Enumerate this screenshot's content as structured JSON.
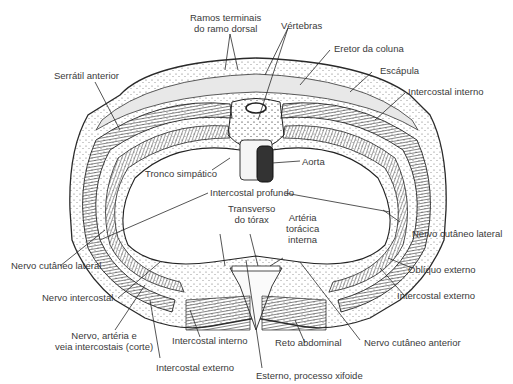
{
  "diagram": {
    "labels": {
      "ramos_terminais_1": "Ramos terminais",
      "ramos_terminais_2": "do ramo dorsal",
      "vertebras": "Vértebras",
      "eretor_da_coluna": "Eretor da coluna",
      "escapula": "Escápula",
      "intercostal_interno_top": "Intercostal interno",
      "serratil_anterior": "Serrátil anterior",
      "tronco_simpatico": "Tronco simpático",
      "aorta": "Aorta",
      "intercostal_profundo": "Intercostal profundo",
      "transverso_1": "Transverso",
      "transverso_2": "do tórax",
      "arteria_1": "Artéria",
      "arteria_2": "torácica",
      "arteria_3": "interna",
      "nervo_cutaneo_lateral_right": "Nervo cutâneo lateral",
      "nervo_cutaneo_lateral_left": "Nervo cutâneo lateral",
      "obliquo_externo": "Oblíquo externo",
      "nervo_intercostal": "Nervo intercostal",
      "intercostal_externo_right": "Intercostal externo",
      "nervo_arteria_1": "Nervo, artéria e",
      "nervo_arteria_2": "veia intercostais (corte)",
      "intercostal_interno_bottom": "Intercostal interno",
      "reto_abdominal": "Reto abdominal",
      "nervo_cutaneo_anterior": "Nervo cutâneo anterior",
      "intercostal_externo_bottom": "Intercostal externo",
      "esterno": "Esterno, processo xifoide"
    },
    "colors": {
      "line": "#2a2a2a",
      "muscle": "#555555",
      "aorta": "#333333",
      "tissue": "#f2f2f2",
      "text": "#3a3a3a"
    }
  }
}
